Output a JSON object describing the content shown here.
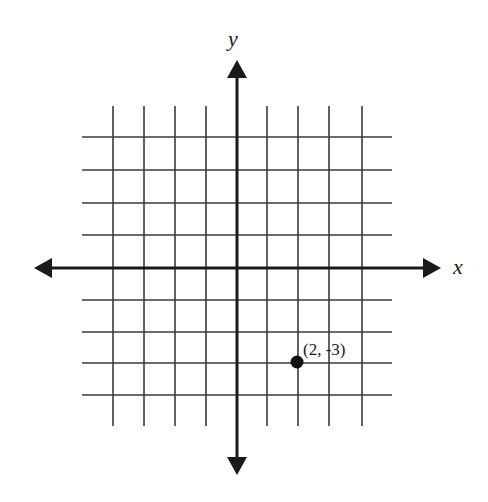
{
  "diagram": {
    "type": "coordinate-plane",
    "axes": {
      "x_label": "x",
      "y_label": "y",
      "origin_px": [
        237,
        268
      ],
      "unit_px_x": 30.5,
      "unit_px_y": 32,
      "x_range": [
        -5,
        5
      ],
      "y_range": [
        -5,
        5
      ]
    },
    "grid": {
      "vertical_lines_x": [
        113,
        144,
        175,
        206,
        267,
        298,
        329,
        362
      ],
      "horizontal_lines_y": [
        137,
        170,
        203,
        235,
        300,
        332,
        363,
        395
      ],
      "h_extent_x": [
        82,
        392
      ],
      "v_extent_y": [
        106,
        426
      ]
    },
    "point": {
      "label": "(2, -3)",
      "x": 2,
      "y": -3,
      "px": [
        297,
        362
      ]
    },
    "colors": {
      "line": "#3a3a3a",
      "axis": "#1a1a1a",
      "point": "#111111",
      "background": "#ffffff"
    }
  }
}
